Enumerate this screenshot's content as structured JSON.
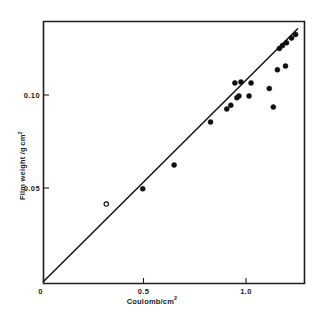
{
  "figure": {
    "background_color": "#ffffff",
    "ink_color": "#121212"
  },
  "chart_data": {
    "type": "scatter",
    "title": "",
    "subtitle": "",
    "xlabel": "Coulomb/cm",
    "xlabel_exponent": "2",
    "ylabel": "Film weight /g",
    "ylabel_unit": "cm",
    "ylabel_exponent": "2",
    "ylabel_full": "Film weight /g cm2",
    "xlim": [
      0.0,
      1.29
    ],
    "ylim": [
      0.0,
      0.141
    ],
    "xticks": [
      0,
      0.5,
      1.0
    ],
    "xticklabels": [
      "0",
      "0.5",
      "1.0"
    ],
    "yticks": [
      0.05,
      0.1
    ],
    "yticklabels": [
      "0.05",
      "0.10"
    ],
    "grid": false,
    "legend": "none",
    "marker_style": "circle",
    "series": [
      {
        "name": "Film weight measurements",
        "marker": "circle",
        "points": [
          {
            "x": 0.31,
            "y": 0.0415,
            "filled": false
          },
          {
            "x": 0.49,
            "y": 0.0497,
            "filled": true
          },
          {
            "x": 0.645,
            "y": 0.0625,
            "filled": true
          },
          {
            "x": 0.825,
            "y": 0.0855,
            "filled": true
          },
          {
            "x": 0.905,
            "y": 0.0925,
            "filled": true
          },
          {
            "x": 0.925,
            "y": 0.0945,
            "filled": true
          },
          {
            "x": 0.955,
            "y": 0.0985,
            "filled": true
          },
          {
            "x": 0.965,
            "y": 0.0995,
            "filled": true
          },
          {
            "x": 0.945,
            "y": 0.1065,
            "filled": true
          },
          {
            "x": 0.975,
            "y": 0.107,
            "filled": true
          },
          {
            "x": 1.025,
            "y": 0.1065,
            "filled": true
          },
          {
            "x": 1.015,
            "y": 0.0995,
            "filled": true
          },
          {
            "x": 1.115,
            "y": 0.1035,
            "filled": true
          },
          {
            "x": 1.135,
            "y": 0.0935,
            "filled": true
          },
          {
            "x": 1.155,
            "y": 0.1135,
            "filled": true
          },
          {
            "x": 1.195,
            "y": 0.1155,
            "filled": true
          },
          {
            "x": 1.165,
            "y": 0.125,
            "filled": true
          },
          {
            "x": 1.18,
            "y": 0.1265,
            "filled": true
          },
          {
            "x": 1.2,
            "y": 0.128,
            "filled": true
          },
          {
            "x": 1.225,
            "y": 0.1305,
            "filled": true
          },
          {
            "x": 1.245,
            "y": 0.1325,
            "filled": true
          }
        ]
      }
    ],
    "fit_line": {
      "description": "linear fit through origin",
      "x_start": 0.0,
      "y_start": 0.0,
      "x_end": 1.255,
      "y_end": 0.1355,
      "slope": 0.108
    }
  }
}
